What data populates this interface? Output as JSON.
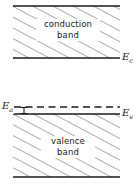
{
  "figure": {
    "background_color": "#ffffff",
    "line_color": "#1a1a1a",
    "hatch_color": "#555555",
    "width": 139,
    "height": 184
  },
  "bands": {
    "conduction": {
      "label_line1": "conduction",
      "label_line2": "band",
      "top_y": 6,
      "bottom_y": 58,
      "left_x": 13,
      "right_x": 120,
      "fill": "hatched"
    },
    "valence": {
      "label_line1": "valence",
      "label_line2": "band",
      "top_y": 114,
      "bottom_y": 177,
      "left_x": 13,
      "right_x": 120,
      "fill": "hatched"
    }
  },
  "levels": [
    {
      "name": "conduction-band-edge",
      "symbol": "E",
      "subscript": "c",
      "y": 58,
      "style": "solid",
      "label_side": "right"
    },
    {
      "name": "valence-band-edge",
      "symbol": "E",
      "subscript": "v",
      "y": 114,
      "style": "solid",
      "label_side": "right"
    },
    {
      "name": "acceptor-level",
      "symbol": "E",
      "subscript": "a",
      "y": 107,
      "style": "dashed",
      "label_side": "left"
    }
  ],
  "annotations": [
    {
      "name": "acceptor-energy-gap-arrow",
      "symbol": "E",
      "subscript": "a",
      "from_y": 107,
      "to_y": 114,
      "x": 24,
      "style": "double-ended-bar"
    }
  ],
  "hatching": {
    "angle_deg": 62,
    "spacing_px": 9.5,
    "stroke_width": 0.9
  }
}
